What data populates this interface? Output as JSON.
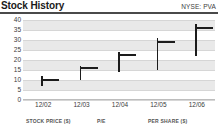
{
  "header": {
    "title": "Stock History",
    "ticker": "NYSE: PVA"
  },
  "footer": {
    "columns": [
      {
        "label": "STOCK PRICE ($)",
        "left": 26
      },
      {
        "label": "P/E",
        "left": 97
      },
      {
        "label": "PER SHARE ($)",
        "left": 148
      }
    ]
  },
  "colors": {
    "marker": "#1c1c1c",
    "band": "#e9e9e9",
    "gridline": "#d6d6d6",
    "rule": "#4a4a4a",
    "text": "#3b3b3b",
    "title": "#1a1a1a"
  },
  "chart_data": {
    "type": "bar",
    "title": "Stock History",
    "subtitle": "NYSE: PVA",
    "xlabel": "",
    "ylabel": "",
    "ylim": [
      0,
      40
    ],
    "yticks": [
      40,
      35,
      30,
      25,
      20,
      15,
      10,
      5,
      0
    ],
    "grid": true,
    "legend": null,
    "categories": [
      "12/02",
      "12/03",
      "12/04",
      "12/05",
      "12/06"
    ],
    "series": [
      {
        "name": "High",
        "values": [
          12.0,
          17.0,
          24.0,
          31.0,
          38.0
        ]
      },
      {
        "name": "Low",
        "values": [
          7.0,
          10.0,
          14.0,
          15.0,
          22.0
        ]
      },
      {
        "name": "Close",
        "values": [
          10.5,
          16.5,
          23.0,
          29.5,
          36.5
        ]
      }
    ],
    "points": [
      {
        "x": "12/02",
        "high": 12.0,
        "low": 7.0,
        "close": 10.5
      },
      {
        "x": "12/03",
        "high": 17.0,
        "low": 10.0,
        "close": 16.5
      },
      {
        "x": "12/04",
        "high": 24.0,
        "low": 14.0,
        "close": 23.0
      },
      {
        "x": "12/05",
        "high": 31.0,
        "low": 15.0,
        "close": 29.5
      },
      {
        "x": "12/06",
        "high": 38.0,
        "low": 22.0,
        "close": 36.5
      }
    ]
  }
}
